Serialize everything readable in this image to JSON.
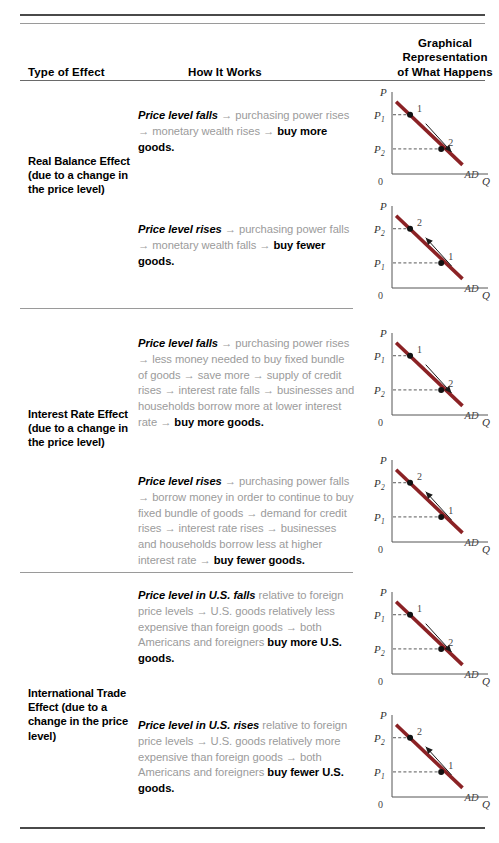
{
  "table": {
    "headers": {
      "col1": "Type of Effect",
      "col2": "How It Works",
      "col3_line1": "Graphical",
      "col3_line2": "Representation",
      "col3_line3": "of What Happens"
    },
    "rows": [
      {
        "effect_label": "Real Balance Effect (due to a change in the price level)",
        "items": [
          {
            "lead": "Price level falls",
            "body": " → purchasing power rises → monetary wealth rises → ",
            "tail": "buy more goods."
          },
          {
            "lead": "Price level rises",
            "body": " → purchasing power falls → monetary wealth falls → ",
            "tail": "buy fewer goods."
          }
        ]
      },
      {
        "effect_label": "Interest Rate Effect (due to a change in the price level)",
        "items": [
          {
            "lead": "Price level falls",
            "body": " → purchasing power rises → less money needed to buy fixed bundle of goods → save more → supply of credit rises → interest rate falls → businesses and households borrow more at lower interest rate → ",
            "tail": "buy more goods."
          },
          {
            "lead": "Price level rises",
            "body": " → purchasing power falls → borrow money in order to continue to buy fixed bundle of goods → demand for credit rises → interest rate rises → businesses and households borrow less at higher interest rate → ",
            "tail": "buy fewer goods."
          }
        ]
      },
      {
        "effect_label": "International Trade Effect (due to a change in the price level)",
        "items": [
          {
            "lead": "Price level in U.S. falls",
            "body": " relative to foreign price levels → U.S. goods relatively less expensive than foreign goods → both Americans and foreigners ",
            "tail": "buy more U.S. goods."
          },
          {
            "lead": "Price level in U.S. rises",
            "body": " relative to foreign price levels → U.S. goods relatively more expensive than foreign goods → both Americans and foreigners ",
            "tail": "buy fewer U.S. goods."
          }
        ]
      }
    ]
  },
  "chart_data": [
    {
      "id": "graph-1",
      "type": "line",
      "title": "Real Balance Effect — price level falls",
      "xlabel": "Q",
      "ylabel": "P",
      "origin_label": "0",
      "curve_label": "AD",
      "curve_color": "#8B2225",
      "points": [
        {
          "label": "1",
          "price_label": "P",
          "price_sub": "1",
          "price_value": 0.78,
          "quantity_value": 0.22
        },
        {
          "label": "2",
          "price_label": "P",
          "price_sub": "2",
          "price_value": 0.33,
          "quantity_value": 0.6
        }
      ],
      "arrow": {
        "from": "1",
        "to": "2",
        "direction": "down-right"
      }
    },
    {
      "id": "graph-2",
      "type": "line",
      "title": "Real Balance Effect — price level rises",
      "xlabel": "Q",
      "ylabel": "P",
      "origin_label": "0",
      "curve_label": "AD",
      "curve_color": "#8B2225",
      "points": [
        {
          "label": "2",
          "price_label": "P",
          "price_sub": "2",
          "price_value": 0.78,
          "quantity_value": 0.22
        },
        {
          "label": "1",
          "price_label": "P",
          "price_sub": "1",
          "price_value": 0.33,
          "quantity_value": 0.6
        }
      ],
      "arrow": {
        "from": "1",
        "to": "2",
        "direction": "up-left"
      }
    },
    {
      "id": "graph-3",
      "type": "line",
      "title": "Interest Rate Effect — price level falls",
      "xlabel": "Q",
      "ylabel": "P",
      "origin_label": "0",
      "curve_label": "AD",
      "curve_color": "#8B2225",
      "points": [
        {
          "label": "1",
          "price_label": "P",
          "price_sub": "1",
          "price_value": 0.78,
          "quantity_value": 0.22
        },
        {
          "label": "2",
          "price_label": "P",
          "price_sub": "2",
          "price_value": 0.33,
          "quantity_value": 0.6
        }
      ],
      "arrow": {
        "from": "1",
        "to": "2",
        "direction": "down-right"
      }
    },
    {
      "id": "graph-4",
      "type": "line",
      "title": "Interest Rate Effect — price level rises",
      "xlabel": "Q",
      "ylabel": "P",
      "origin_label": "0",
      "curve_label": "AD",
      "curve_color": "#8B2225",
      "points": [
        {
          "label": "2",
          "price_label": "P",
          "price_sub": "2",
          "price_value": 0.78,
          "quantity_value": 0.22
        },
        {
          "label": "1",
          "price_label": "P",
          "price_sub": "1",
          "price_value": 0.33,
          "quantity_value": 0.6
        }
      ],
      "arrow": {
        "from": "1",
        "to": "2",
        "direction": "up-left"
      }
    },
    {
      "id": "graph-5",
      "type": "line",
      "title": "International Trade Effect — price level falls",
      "xlabel": "Q",
      "ylabel": "P",
      "origin_label": "0",
      "curve_label": "AD",
      "curve_color": "#8B2225",
      "points": [
        {
          "label": "1",
          "price_label": "P",
          "price_sub": "1",
          "price_value": 0.78,
          "quantity_value": 0.22
        },
        {
          "label": "2",
          "price_label": "P",
          "price_sub": "2",
          "price_value": 0.33,
          "quantity_value": 0.6
        }
      ],
      "arrow": {
        "from": "1",
        "to": "2",
        "direction": "down-right"
      }
    },
    {
      "id": "graph-6",
      "type": "line",
      "title": "International Trade Effect — price level rises",
      "xlabel": "Q",
      "ylabel": "P",
      "origin_label": "0",
      "curve_label": "AD",
      "curve_color": "#8B2225",
      "points": [
        {
          "label": "2",
          "price_label": "P",
          "price_sub": "2",
          "price_value": 0.78,
          "quantity_value": 0.22
        },
        {
          "label": "1",
          "price_label": "P",
          "price_sub": "1",
          "price_value": 0.33,
          "quantity_value": 0.6
        }
      ],
      "arrow": {
        "from": "1",
        "to": "2",
        "direction": "up-left"
      }
    }
  ]
}
